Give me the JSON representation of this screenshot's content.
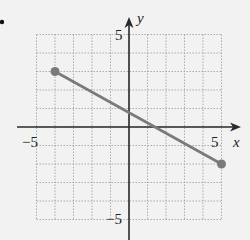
{
  "chart_data": {
    "type": "line",
    "title": "",
    "xlabel": "x",
    "ylabel": "y",
    "xlim": [
      -5,
      5
    ],
    "ylim": [
      -5,
      5
    ],
    "grid": true,
    "grid_step": 1,
    "x_tick_labels": [
      "-5",
      "5"
    ],
    "y_tick_labels": [
      "5",
      "-5"
    ],
    "series": [
      {
        "name": "segment",
        "points": [
          [
            -4,
            3
          ],
          [
            5,
            -2
          ]
        ],
        "endpoints": "closed-dots",
        "color": "#7a7a7a"
      }
    ]
  },
  "labels": {
    "x_axis": "x",
    "y_axis": "y",
    "x_min": "−5",
    "x_max": "5",
    "y_max": "5",
    "y_min": "−5"
  },
  "colors": {
    "background": "#f2f2f2",
    "axis": "#2a2a2a",
    "grid": "#9a9a9a",
    "segment": "#7a7a7a"
  }
}
